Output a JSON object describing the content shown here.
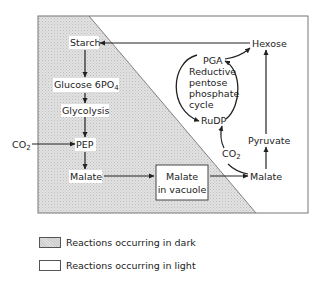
{
  "diagram": {
    "nodes": {
      "starch": "Starch",
      "glucose": "Glucose 6PO",
      "glucose_sub": "4",
      "glycolysis": "Glycolysis",
      "pep": "PEP",
      "malate_left": "Malate",
      "malate_vacuole_line1": "Malate",
      "malate_vacuole_line2": "in vacuole",
      "malate_right": "Malate",
      "pyruvate": "Pyruvate",
      "hexose": "Hexose",
      "pga": "PGA",
      "rudp": "RuDP",
      "cycle_line1": "Reductive",
      "cycle_line2": "pentose",
      "cycle_line3": "phosphate",
      "cycle_line4": "cycle",
      "co2_left": "CO",
      "co2_left_sub": "2",
      "co2_right": "CO",
      "co2_right_sub": "2"
    },
    "colors": {
      "dark_region": "#dedede",
      "line": "#222222",
      "frame": "#777777"
    }
  },
  "legend": [
    {
      "pattern": "dark",
      "label": "Reactions occurring in dark"
    },
    {
      "pattern": "light",
      "label": "Reactions occurring in light"
    }
  ]
}
